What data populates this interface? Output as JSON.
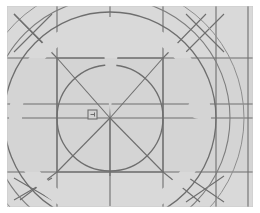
{
  "document": {
    "title": "Geometric Construction Diagram",
    "kind": "vector-line-drawing"
  },
  "canvas": {
    "width": 260,
    "height": 213,
    "background_color": "#ffffff",
    "plate_color": "#d4d4d4",
    "plate_rect": {
      "x": 7,
      "y": 6,
      "width": 246,
      "height": 201
    }
  },
  "palette": {
    "paper_white": "#ffffff",
    "plate_gray": "#d4d4d4",
    "plate_gray_light": "#dcdcdc",
    "line_gray": "#6e6e6e",
    "line_gray_soft": "#8a8a8a",
    "line_gray_faint": "#a8a8a8",
    "mask_white": "#ffffff"
  },
  "geometry": {
    "center": {
      "x": 110,
      "y": 118
    },
    "origin_label": "center-point",
    "grid": {
      "visible": true,
      "stroke": "#6e6e6e",
      "stroke_width": 1.1,
      "vertical_lines_x": [
        57,
        110,
        163,
        216,
        248
      ],
      "horizontal_lines_y": [
        58,
        104,
        118,
        172
      ]
    },
    "circles": [
      {
        "name": "inner-circle",
        "cx": 110,
        "cy": 118,
        "r": 53,
        "stroke": "#6e6e6e",
        "stroke_width": 1.2
      },
      {
        "name": "mid-circle",
        "cx": 110,
        "cy": 118,
        "r": 106,
        "stroke": "#6e6e6e",
        "stroke_width": 1.2
      },
      {
        "name": "outer-circle",
        "cx": 110,
        "cy": 118,
        "r": 120,
        "stroke": "#7a7a7a",
        "stroke_width": 1.1
      },
      {
        "name": "outermost-circle",
        "cx": 110,
        "cy": 118,
        "r": 134,
        "stroke": "#8a8a8a",
        "stroke_width": 1.0
      }
    ],
    "diagonals": [
      {
        "name": "diagonal-ne",
        "x1": 110,
        "y1": 118,
        "x2": 163,
        "y2": 58
      },
      {
        "name": "diagonal-nw",
        "x1": 110,
        "y1": 118,
        "x2": 57,
        "y2": 58
      },
      {
        "name": "diagonal-se",
        "x1": 110,
        "y1": 118,
        "x2": 163,
        "y2": 172
      },
      {
        "name": "diagonal-sw",
        "x1": 110,
        "y1": 118,
        "x2": 57,
        "y2": 172
      },
      {
        "name": "ray-south",
        "x1": 110,
        "y1": 118,
        "x2": 110,
        "y2": 176
      },
      {
        "name": "ray-east",
        "x1": 110,
        "y1": 118,
        "x2": 170,
        "y2": 118
      },
      {
        "name": "ray-west",
        "x1": 110,
        "y1": 118,
        "x2": 50,
        "y2": 118
      }
    ],
    "bounding_square": {
      "name": "inscribed-square",
      "x": 57,
      "y": 58,
      "width": 106,
      "height": 114,
      "stroke": "#6e6e6e"
    },
    "corner_crosses": [
      {
        "name": "cross-top-left",
        "x": 28,
        "y": 28,
        "size": 30
      },
      {
        "name": "cross-top-right",
        "x": 200,
        "y": 28,
        "size": 30
      },
      {
        "name": "cross-bottom-left",
        "x": 28,
        "y": 196,
        "size": 30
      },
      {
        "name": "cross-bottom-right",
        "x": 196,
        "y": 190,
        "size": 30
      }
    ],
    "white_ring": {
      "name": "white-annulus-mask",
      "cx": 110,
      "cy": 118,
      "inner_radius": 88,
      "outer_radius": 101,
      "color": "#ffffff"
    },
    "white_wedge": {
      "name": "white-wedge-mask",
      "apex": {
        "x": 110,
        "y": 116
      },
      "top_left": {
        "x": 101,
        "y": 26
      },
      "top_right": {
        "x": 122,
        "y": 26
      },
      "color": "#ffffff"
    },
    "ring_notch": {
      "name": "ring-notch-bump",
      "cx": 199,
      "cy": 108,
      "r": 11,
      "color": "#ffffff"
    },
    "square_marker": {
      "name": "center-square-marker",
      "x": 88,
      "y": 110,
      "width": 9,
      "height": 9,
      "stroke": "#6e6e6e",
      "fill": "#d4d4d4",
      "inner_tick": true
    }
  },
  "annotations": {
    "visible_text": [],
    "labels_present": false
  }
}
